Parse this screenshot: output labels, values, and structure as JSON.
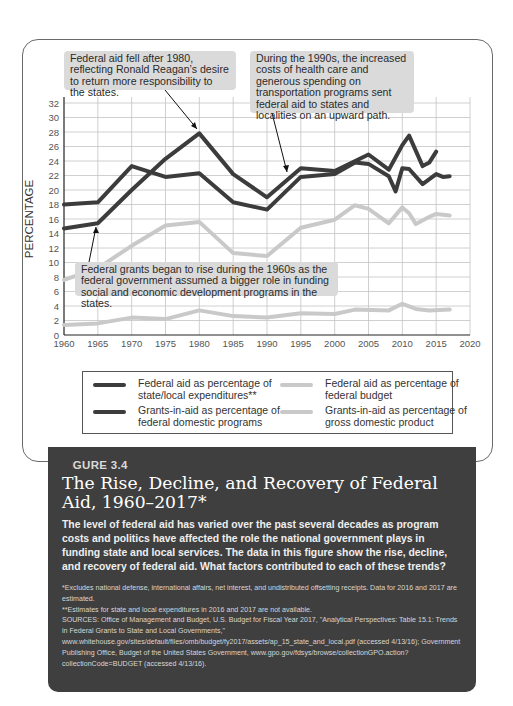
{
  "figure": {
    "label": "FIGURE 3.4",
    "title": "The Rise, Decline, and Recovery of Federal Aid, 1960–2017*",
    "description": "The level of federal aid has varied over the past several decades as program costs and politics have affected the role the national government plays in funding state and local services. The data in this figure show the rise, decline, and recovery of federal aid. What factors contributed to each of these trends?",
    "notes": [
      "*Excludes national defense, international affairs, net interest, and undistributed offsetting receipts. Data for 2016 and 2017 are estimated.",
      "**Estimates for state and local expenditures in 2016 and 2017 are not available.",
      "SOURCES: Office of Management and Budget, U.S. Budget for Fiscal Year 2017, \"Analytical Perspectives: Table 15.1: Trends in Federal Grants to State and Local Governments,\" www.whitehouse.gov/sites/default/files/omb/budget/fy2017/assets/ap_15_state_and_local.pdf (accessed 4/13/16); Government Publishing Office, Budget of the United States Government, www.gpo.gov/fdsys/browse/collectionGPO.action?collectionCode=BUDGET (accessed 4/13/16)."
    ]
  },
  "annotations": [
    {
      "text": "Federal aid fell after 1980, reflecting Ronald Reagan’s desire to return more responsibility to the states."
    },
    {
      "text": "During the 1990s, the increased costs of health care and generous spending on transportation programs sent federal aid to states and localities on an upward path."
    },
    {
      "text": "Federal grants began to rise during the 1960s as the federal government assumed a bigger role in funding social and economic development programs in the states."
    }
  ],
  "legend": [
    {
      "label": "Federal aid as percentage of state/local expenditures**",
      "color": "#3c3c3c"
    },
    {
      "label": "Grants-in-aid as percentage of federal domestic programs",
      "color": "#3c3c3c"
    },
    {
      "label": "Federal aid as percentage of federal budget",
      "color": "#c9c9c9"
    },
    {
      "label": "Grants-in-aid as percentage of gross domestic product",
      "color": "#c9c9c9"
    }
  ],
  "chart_data": {
    "type": "line",
    "title": "The Rise, Decline, and Recovery of Federal Aid, 1960–2017*",
    "xlabel": "",
    "ylabel": "PERCENTAGE",
    "xlim": [
      1960,
      2020
    ],
    "ylim": [
      0,
      32
    ],
    "x_ticks": [
      1960,
      1965,
      1970,
      1975,
      1980,
      1985,
      1990,
      1995,
      2000,
      2005,
      2010,
      2015,
      2020
    ],
    "y_ticks": [
      0,
      2,
      4,
      6,
      8,
      10,
      12,
      14,
      16,
      18,
      20,
      22,
      24,
      26,
      28,
      30,
      32
    ],
    "grid": true,
    "legend_position": "bottom",
    "series": [
      {
        "name": "Federal aid as percentage of state/local expenditures**",
        "color": "#3c3c3c",
        "x": [
          1960,
          1965,
          1970,
          1975,
          1980,
          1985,
          1990,
          1995,
          2000,
          2005,
          2008,
          2010,
          2011,
          2013,
          2014,
          2015
        ],
        "values": [
          14.7,
          15.4,
          20.0,
          24.3,
          27.8,
          22.2,
          19.0,
          23.0,
          22.6,
          24.9,
          22.8,
          26.2,
          27.5,
          23.3,
          23.8,
          25.3
        ]
      },
      {
        "name": "Grants-in-aid as percentage of federal domestic programs",
        "color": "#3c3c3c",
        "x": [
          1960,
          1965,
          1970,
          1975,
          1980,
          1985,
          1990,
          1995,
          2000,
          2003,
          2005,
          2008,
          2009,
          2010,
          2011,
          2013,
          2015,
          2016,
          2017
        ],
        "values": [
          18.0,
          18.3,
          23.3,
          21.8,
          22.3,
          18.3,
          17.3,
          21.8,
          22.2,
          23.8,
          23.6,
          21.9,
          19.8,
          23.0,
          22.9,
          20.8,
          22.2,
          21.8,
          21.9
        ]
      },
      {
        "name": "Federal aid as percentage of federal budget",
        "color": "#c9c9c9",
        "x": [
          1960,
          1965,
          1970,
          1975,
          1980,
          1985,
          1990,
          1995,
          2000,
          2003,
          2005,
          2008,
          2010,
          2011,
          2012,
          2014,
          2015,
          2017
        ],
        "values": [
          7.6,
          9.2,
          12.3,
          15.1,
          15.6,
          11.3,
          10.9,
          14.8,
          15.9,
          17.9,
          17.4,
          15.4,
          17.6,
          16.8,
          15.3,
          16.3,
          16.7,
          16.5
        ]
      },
      {
        "name": "Grants-in-aid as percentage of gross domestic product",
        "color": "#c9c9c9",
        "x": [
          1960,
          1965,
          1970,
          1975,
          1980,
          1985,
          1990,
          1995,
          2000,
          2003,
          2008,
          2010,
          2012,
          2014,
          2017
        ],
        "values": [
          1.4,
          1.6,
          2.4,
          2.2,
          3.4,
          2.6,
          2.4,
          3.0,
          2.9,
          3.5,
          3.4,
          4.3,
          3.6,
          3.4,
          3.5
        ]
      }
    ],
    "annotations": [
      "Federal aid fell after 1980, reflecting Ronald Reagan’s desire to return more responsibility to the states.",
      "During the 1990s, the increased costs of health care and generous spending on transportation programs sent federal aid to states and localities on an upward path.",
      "Federal grants began to rise during the 1960s as the federal government assumed a bigger role in funding social and economic development programs in the states."
    ]
  }
}
